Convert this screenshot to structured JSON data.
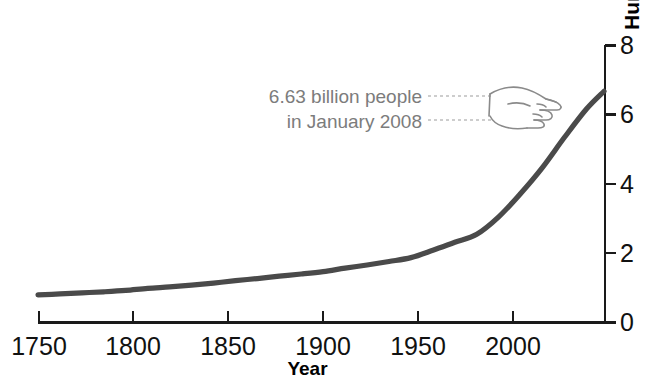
{
  "chart_data": {
    "type": "line",
    "title": "",
    "subtitle": "",
    "xlabel": "Year",
    "ylabel": "Human population size (in billions)",
    "xlim": [
      1750,
      2008
    ],
    "ylim": [
      0,
      8
    ],
    "xticks": [
      1750,
      1800,
      1850,
      1900,
      1950,
      2000
    ],
    "xtick_labels": [
      "1750",
      "1800",
      "1850",
      "1900",
      "1950",
      "2000"
    ],
    "yticks": [
      0,
      2,
      4,
      6,
      8
    ],
    "ytick_labels": [
      "0",
      "2",
      "4",
      "6",
      "8"
    ],
    "y_axis_position": "right",
    "grid": false,
    "legend": null,
    "series": [
      {
        "name": "World human population",
        "units": "billions",
        "x": [
          1750,
          1760,
          1770,
          1780,
          1790,
          1800,
          1810,
          1820,
          1830,
          1840,
          1850,
          1860,
          1870,
          1880,
          1890,
          1900,
          1910,
          1920,
          1930,
          1940,
          1950,
          1960,
          1970,
          1980,
          1990,
          2000,
          2008
        ],
        "values": [
          0.79,
          0.82,
          0.85,
          0.88,
          0.92,
          0.98,
          1.02,
          1.07,
          1.13,
          1.2,
          1.26,
          1.33,
          1.39,
          1.46,
          1.56,
          1.65,
          1.75,
          1.86,
          2.07,
          2.3,
          2.53,
          3.03,
          3.7,
          4.45,
          5.31,
          6.12,
          6.63
        ]
      }
    ],
    "annotations": [
      {
        "text_lines": [
          "6.63 billion people",
          "in January 2008"
        ],
        "points_to_year": 2008,
        "points_to_value": 6.63,
        "marker": "pointing-hand"
      }
    ],
    "line_color": "#4a4a4a",
    "axis_color": "#1a1a1a",
    "annotation_color": "#7c7c7c"
  },
  "axes": {
    "x_title": "Year",
    "y_title": "Human population size (in billions)"
  },
  "annotation": {
    "line1": "6.63 billion people",
    "line2": "in January 2008"
  }
}
